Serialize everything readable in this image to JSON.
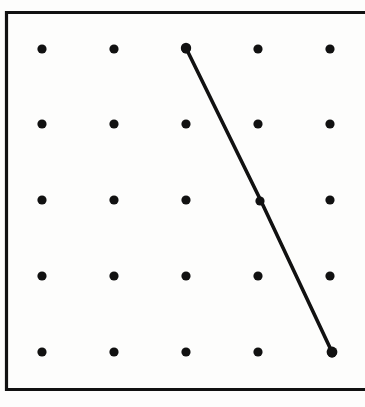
{
  "figure": {
    "title": "Geoboard with five-by-five peg grid and one drawn segment",
    "background_color": "#fdfdfc",
    "ink_color": "#111111",
    "canvas": {
      "width": 365,
      "height": 407
    }
  },
  "board": {
    "name": "geoboard-frame",
    "frame": {
      "left": 6.5,
      "top": 12.5,
      "right": 366,
      "bottom": 389.5,
      "stroke_width": 3.2,
      "color": "#111111",
      "right_edge_cropped": true
    }
  },
  "grid": {
    "rows": 5,
    "columns": 5,
    "dot_radius": 4.6,
    "dot_color": "#111111",
    "x_positions": [
      42,
      114,
      186,
      258,
      330
    ],
    "y_positions": [
      49,
      124,
      200,
      276,
      352
    ],
    "column_spacing": 72,
    "row_spacing": 75.75,
    "dots": [
      {
        "row": 1,
        "col": 1,
        "x": 42,
        "y": 49
      },
      {
        "row": 1,
        "col": 2,
        "x": 114,
        "y": 49
      },
      {
        "row": 1,
        "col": 3,
        "x": 186,
        "y": 49
      },
      {
        "row": 1,
        "col": 4,
        "x": 258,
        "y": 49
      },
      {
        "row": 1,
        "col": 5,
        "x": 330,
        "y": 49
      },
      {
        "row": 2,
        "col": 1,
        "x": 42,
        "y": 124
      },
      {
        "row": 2,
        "col": 2,
        "x": 114,
        "y": 124
      },
      {
        "row": 2,
        "col": 3,
        "x": 186,
        "y": 124
      },
      {
        "row": 2,
        "col": 4,
        "x": 258,
        "y": 124
      },
      {
        "row": 2,
        "col": 5,
        "x": 330,
        "y": 124
      },
      {
        "row": 3,
        "col": 1,
        "x": 42,
        "y": 200
      },
      {
        "row": 3,
        "col": 2,
        "x": 114,
        "y": 200
      },
      {
        "row": 3,
        "col": 3,
        "x": 186,
        "y": 200
      },
      {
        "row": 3,
        "col": 4,
        "x": 260,
        "y": 201
      },
      {
        "row": 3,
        "col": 5,
        "x": 330,
        "y": 200
      },
      {
        "row": 4,
        "col": 1,
        "x": 42,
        "y": 276
      },
      {
        "row": 4,
        "col": 2,
        "x": 114,
        "y": 276
      },
      {
        "row": 4,
        "col": 3,
        "x": 186,
        "y": 276
      },
      {
        "row": 4,
        "col": 4,
        "x": 258,
        "y": 276
      },
      {
        "row": 4,
        "col": 5,
        "x": 330,
        "y": 276
      },
      {
        "row": 5,
        "col": 1,
        "x": 42,
        "y": 352
      },
      {
        "row": 5,
        "col": 2,
        "x": 114,
        "y": 352
      },
      {
        "row": 5,
        "col": 3,
        "x": 186,
        "y": 352
      },
      {
        "row": 5,
        "col": 4,
        "x": 258,
        "y": 352
      },
      {
        "row": 5,
        "col": 5,
        "x": 332,
        "y": 353
      }
    ]
  },
  "segments": [
    {
      "name": "diagonal-band-segment",
      "from": {
        "row": 1,
        "col": 3,
        "x": 186,
        "y": 48
      },
      "through": {
        "row": 3,
        "col": 4,
        "x": 261,
        "y": 201
      },
      "to": {
        "row": 5,
        "col": 5,
        "x": 332,
        "y": 352
      },
      "stroke_width": 3.6,
      "color": "#111111"
    }
  ],
  "endpoint_markers": [
    {
      "name": "segment-start-marker",
      "x": 186,
      "y": 48,
      "radius": 5.2
    },
    {
      "name": "segment-end-marker",
      "x": 332,
      "y": 352,
      "radius": 5.4
    }
  ]
}
